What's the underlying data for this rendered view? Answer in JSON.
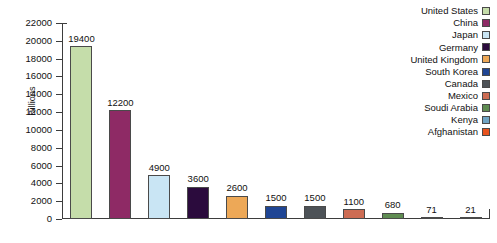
{
  "chart_data": {
    "type": "bar",
    "title": "",
    "xlabel": "",
    "ylabel": "Billions",
    "ylim": [
      0,
      22000
    ],
    "ytick_step": 2000,
    "yticks": [
      0,
      2000,
      4000,
      6000,
      8000,
      10000,
      12000,
      14000,
      16000,
      18000,
      20000,
      22000
    ],
    "grid": false,
    "legend_position": "top-right",
    "show_value_labels": true,
    "categories": [
      "United States",
      "China",
      "Japan",
      "Germany",
      "United Kingdom",
      "South Korea",
      "Canada",
      "Mexico",
      "Soudi Arabia",
      "Kenya",
      "Afghanistan"
    ],
    "values": [
      19400,
      12200,
      4900,
      3600,
      2600,
      1500,
      1500,
      1100,
      680,
      71,
      21
    ],
    "value_labels": [
      "19400",
      "12200",
      "4900",
      "3600",
      "2600",
      "1500",
      "1500",
      "1100",
      "680",
      "71",
      "21"
    ],
    "colors": [
      "#c5ddaa",
      "#8e2a65",
      "#c9e5f4",
      "#2b0b3d",
      "#eda857",
      "#1f4594",
      "#4d5257",
      "#cd6c53",
      "#5f8c52",
      "#6fa4c4",
      "#e8531e"
    ]
  },
  "legend": {
    "items": [
      {
        "label": "United States",
        "color": "#c5ddaa"
      },
      {
        "label": "China",
        "color": "#8e2a65"
      },
      {
        "label": "Japan",
        "color": "#c9e5f4"
      },
      {
        "label": "Germany",
        "color": "#2b0b3d"
      },
      {
        "label": "United Kingdom",
        "color": "#eda857"
      },
      {
        "label": "South Korea",
        "color": "#1f4594"
      },
      {
        "label": "Canada",
        "color": "#4d5257"
      },
      {
        "label": "Mexico",
        "color": "#cd6c53"
      },
      {
        "label": "Soudi Arabia",
        "color": "#5f8c52"
      },
      {
        "label": "Kenya",
        "color": "#6fa4c4"
      },
      {
        "label": "Afghanistan",
        "color": "#e8531e"
      }
    ]
  },
  "axes": {
    "y_title": "Billions",
    "y_tick_labels": [
      "22000",
      "20000",
      "18000",
      "16000",
      "14000",
      "12000",
      "10000",
      "8000",
      "6000",
      "4000",
      "2000",
      "0"
    ]
  }
}
